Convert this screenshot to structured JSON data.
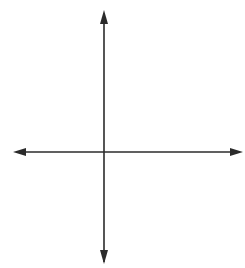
{
  "chart_data": {
    "type": "scatter",
    "title": "",
    "xlabel": "x",
    "ylabel": "y",
    "origin_label": "O",
    "xlim": [
      -3,
      4.5
    ],
    "ylim": [
      -4,
      5
    ],
    "grid": true,
    "x_tick_labels": [
      {
        "value": -2,
        "label": "−2"
      },
      {
        "value": 2,
        "label": "2"
      }
    ],
    "y_tick_labels": [
      {
        "value": 4,
        "label": "4"
      },
      {
        "value": 2,
        "label": "2"
      },
      {
        "value": -2,
        "label": "−2"
      }
    ],
    "points": [
      {
        "x": -2,
        "y": 3
      },
      {
        "x": -1,
        "y": 1
      },
      {
        "x": 2,
        "y": 3
      },
      {
        "x": 4,
        "y": 1
      },
      {
        "x": -2,
        "y": -3
      },
      {
        "x": 4,
        "y": -3
      }
    ]
  },
  "colors": {
    "grid": "#d4d4d4",
    "axis": "#2b2b2b",
    "point": "#3a3a3a"
  }
}
